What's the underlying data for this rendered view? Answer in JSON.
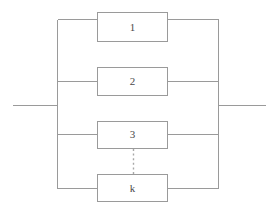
{
  "figure": {
    "type": "reliability-block-diagram",
    "background_color": "#ffffff",
    "line_color": "#9a9a9a",
    "label_color": "#4a4a4a",
    "canvas": {
      "width": 272,
      "height": 212
    }
  },
  "diagram_data": {
    "type": "block-diagram",
    "topology": "parallel",
    "branch_count_label": "k",
    "blocks": [
      {
        "id": "block-1",
        "label": "1",
        "x": 97,
        "y": 12,
        "width": 71,
        "height": 30,
        "branch_y": 27,
        "continuation": false
      },
      {
        "id": "block-2",
        "label": "2",
        "x": 97,
        "y": 67,
        "width": 71,
        "height": 29,
        "branch_y": 81,
        "continuation": false
      },
      {
        "id": "block-3",
        "label": "3",
        "x": 97,
        "y": 121,
        "width": 71,
        "height": 28,
        "branch_y": 134,
        "continuation": false
      },
      {
        "id": "block-k",
        "label": "k",
        "x": 97,
        "y": 174,
        "width": 71,
        "height": 28,
        "branch_y": 188,
        "continuation": true
      }
    ],
    "bus": {
      "left_x": 57,
      "right_x": 219,
      "top_y": 19,
      "bottom_y": 188
    },
    "terminals": {
      "input": {
        "x1": 12,
        "x2": 57,
        "y": 105
      },
      "output": {
        "x1": 219,
        "x2": 265,
        "y": 105
      }
    },
    "ellipsis": {
      "x": 133,
      "y1": 149,
      "y2": 174,
      "style": "vertical-dotted",
      "meaning": "blocks 4 through k-1 omitted"
    }
  }
}
